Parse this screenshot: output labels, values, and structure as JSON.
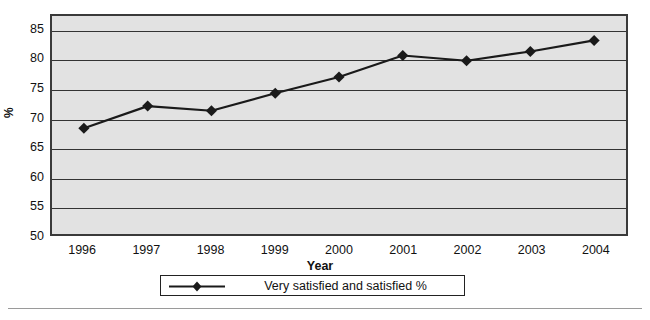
{
  "chart_data": {
    "type": "line",
    "title": "",
    "subtitle": "",
    "xlabel": "Year",
    "ylabel": "%",
    "categories": [
      "1996",
      "1997",
      "1998",
      "1999",
      "2000",
      "2001",
      "2002",
      "2003",
      "2004"
    ],
    "x": [
      1996,
      1997,
      1998,
      1999,
      2000,
      2001,
      2002,
      2003,
      2004
    ],
    "series": [
      {
        "name": "Very satisfied and satisfied %",
        "values": [
          68.2,
          72.0,
          71.2,
          74.2,
          77.0,
          80.7,
          79.8,
          81.4,
          83.3
        ],
        "color": "#1a1a1a",
        "marker": "diamond",
        "line_width": 2.2
      }
    ],
    "ylim": [
      50,
      87.5
    ],
    "yticks": [
      50,
      55,
      60,
      65,
      70,
      75,
      80,
      85
    ],
    "ytick_labels": [
      "50",
      "55",
      "60",
      "65",
      "70",
      "75",
      "80",
      "85"
    ],
    "grid": true,
    "grid_axis": "y",
    "grid_color": "#333333",
    "plot_background": "#e2e2e2",
    "frame_color": "#3a3a3a",
    "legend_position": "bottom-center",
    "legend_entries": [
      "Very satisfied and satisfied %"
    ],
    "annotations": []
  },
  "axes": {
    "y_title": "%",
    "x_title": "Year"
  },
  "legend": {
    "entries": [
      {
        "label": "Very satisfied and satisfied %",
        "marker": "diamond-line-marker"
      }
    ]
  }
}
